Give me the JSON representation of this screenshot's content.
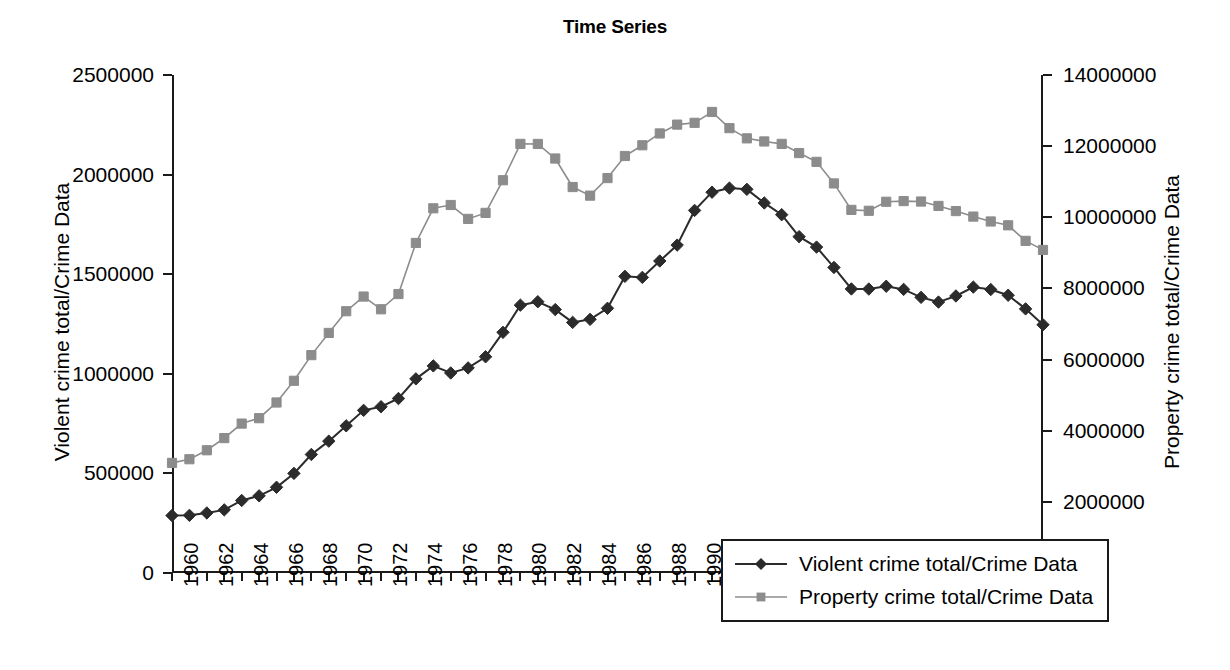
{
  "page": {
    "top_cut_text": "g                                              p  y"
  },
  "chart_data": {
    "type": "line",
    "title": "Time Series",
    "xlabel": "",
    "ylabel": "Violent crime total/Crime Data",
    "y2label": "Property crime total/Crime Data",
    "grid": false,
    "legend_position": "center-bottom-inside",
    "x": [
      1960,
      1961,
      1962,
      1963,
      1964,
      1965,
      1966,
      1967,
      1968,
      1969,
      1970,
      1971,
      1972,
      1973,
      1974,
      1975,
      1976,
      1977,
      1978,
      1979,
      1980,
      1981,
      1982,
      1983,
      1984,
      1985,
      1986,
      1987,
      1988,
      1989,
      1990,
      1991,
      1992,
      1993,
      1994,
      1995,
      1996,
      1997,
      1998,
      1999,
      2000,
      2001,
      2002,
      2003,
      2004,
      2005,
      2006,
      2007,
      2008,
      2009,
      2010
    ],
    "x_tick_labels": [
      "1960",
      "1962",
      "1964",
      "1966",
      "1968",
      "1970",
      "1972",
      "1974",
      "1976",
      "1978",
      "1980",
      "1982",
      "1984",
      "1986",
      "1988",
      "1990",
      "1992",
      "1994",
      "1996",
      "1998",
      "2000",
      "2002",
      "2004",
      "2006",
      "2008",
      "2010"
    ],
    "ylim": [
      0,
      2500000
    ],
    "y_tick_labels": [
      "0",
      "500000",
      "1000000",
      "1500000",
      "2000000",
      "2500000"
    ],
    "y_ticks": [
      0,
      500000,
      1000000,
      1500000,
      2000000,
      2500000
    ],
    "y2lim": [
      0,
      14000000
    ],
    "y2_tick_labels": [
      "0",
      "2000000",
      "4000000",
      "6000000",
      "8000000",
      "10000000",
      "12000000",
      "14000000"
    ],
    "y2_ticks": [
      0,
      2000000,
      4000000,
      6000000,
      8000000,
      10000000,
      12000000,
      14000000
    ],
    "series": [
      {
        "name": "Violent crime total/Crime Data",
        "axis": "left",
        "color": "#2b2b2b",
        "marker": "diamond",
        "values": [
          288460,
          289390,
          301510,
          316970,
          364220,
          387390,
          430180,
          499930,
          595010,
          661870,
          738820,
          816500,
          834900,
          875910,
          974720,
          1039710,
          1004210,
          1029580,
          1085550,
          1208030,
          1344520,
          1361820,
          1322390,
          1258087,
          1273282,
          1328800,
          1489169,
          1483999,
          1566221,
          1646037,
          1820127,
          1911767,
          1932274,
          1926017,
          1857670,
          1798792,
          1688540,
          1636096,
          1533887,
          1426044,
          1425486,
          1439480,
          1423677,
          1383676,
          1360088,
          1390745,
          1435123,
          1422970,
          1394461,
          1325896,
          1246248
        ]
      },
      {
        "name": "Property crime total/Crime Data",
        "axis": "right",
        "color": "#8c8c8c",
        "marker": "square",
        "values": [
          3095700,
          3198600,
          3450700,
          3792500,
          4200400,
          4352000,
          4793300,
          5403500,
          6125200,
          6749000,
          7359200,
          7771700,
          7413900,
          7842200,
          9278700,
          10252700,
          10345500,
          9955000,
          10123400,
          11041500,
          12063700,
          12061900,
          11652000,
          10850500,
          10608500,
          11102600,
          11722700,
          12024700,
          12356900,
          12605400,
          12655500,
          12961100,
          12505900,
          12218800,
          12131900,
          12063900,
          11805300,
          11558475,
          10951827,
          10208334,
          10182584,
          10437189,
          10455277,
          10442862,
          10319386,
          10174754,
          10019601,
          9882212,
          9774152,
          9337060,
          9082887
        ]
      }
    ]
  },
  "legend": {
    "items": [
      {
        "label": "Violent crime total/Crime Data",
        "color": "#2b2b2b",
        "marker": "diamond"
      },
      {
        "label": "Property crime total/Crime Data",
        "color": "#8c8c8c",
        "marker": "square"
      }
    ]
  }
}
